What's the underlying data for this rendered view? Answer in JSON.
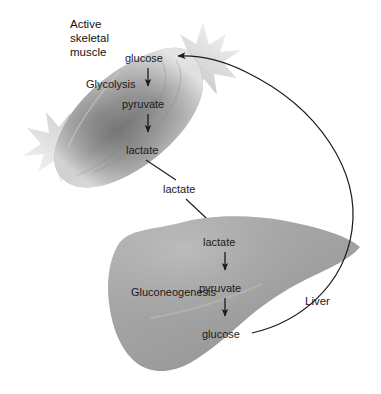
{
  "figure": {
    "name": "Cori cycle diagram",
    "background_color": "#ffffff"
  },
  "muscle": {
    "title_line1": "Active",
    "title_line2": "skeletal",
    "title_line3": "muscle",
    "body_color": "#9a9a9a",
    "tendon_color": "#d8d8d8",
    "pathway_label": "Glycolysis",
    "metabolites": [
      {
        "id": "muscle-glucose",
        "label": "glucose"
      },
      {
        "id": "muscle-pyruvate",
        "label": "pyruvate"
      },
      {
        "id": "muscle-lactate",
        "label": "lactate"
      }
    ]
  },
  "blood": {
    "transport_label": "lactate"
  },
  "liver": {
    "title": "Liver",
    "body_color": "#a5a5a5",
    "pathway_label": "Gluconeogenesis",
    "metabolites": [
      {
        "id": "liver-lactate",
        "label": "lactate"
      },
      {
        "id": "liver-pyruvate",
        "label": "pyruvate"
      },
      {
        "id": "liver-glucose",
        "label": "glucose"
      }
    ]
  },
  "arrows": {
    "return_arrow_name": "liver-glucose-to-muscle-glucose"
  }
}
